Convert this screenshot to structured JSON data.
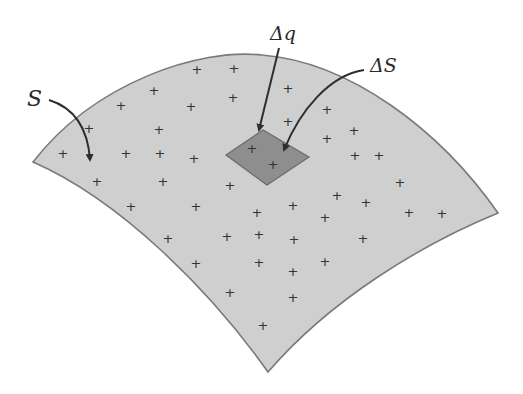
{
  "diagram": {
    "type": "surface-charge-density",
    "labels": {
      "surface": "S",
      "charge_element": "Δq",
      "area_element": "ΔS"
    },
    "colors": {
      "surface_fill": "#cfcfcf",
      "surface_edge": "#7a7a7a",
      "patch_fill": "#8e8e8e",
      "patch_edge": "#6a6a6a",
      "arrow": "#2e2e2e",
      "charge_mark": "#333333"
    },
    "charge_symbol": "+",
    "charges": [
      [
        197,
        69
      ],
      [
        234,
        68
      ],
      [
        154,
        90
      ],
      [
        233,
        97
      ],
      [
        121,
        105
      ],
      [
        191,
        106
      ],
      [
        89,
        128
      ],
      [
        159,
        129
      ],
      [
        160,
        153
      ],
      [
        63,
        153
      ],
      [
        126,
        153
      ],
      [
        194,
        158
      ],
      [
        97,
        181
      ],
      [
        163,
        181
      ],
      [
        230,
        185
      ],
      [
        131,
        206
      ],
      [
        196,
        206
      ],
      [
        257,
        212
      ],
      [
        168,
        238
      ],
      [
        227,
        236
      ],
      [
        259,
        234
      ],
      [
        196,
        263
      ],
      [
        259,
        262
      ],
      [
        230,
        292
      ],
      [
        293,
        297
      ],
      [
        263,
        325
      ],
      [
        293,
        271
      ],
      [
        325,
        261
      ],
      [
        294,
        239
      ],
      [
        325,
        217
      ],
      [
        363,
        238
      ],
      [
        293,
        205
      ],
      [
        337,
        195
      ],
      [
        366,
        202
      ],
      [
        409,
        212
      ],
      [
        442,
        213
      ],
      [
        400,
        182
      ],
      [
        379,
        155
      ],
      [
        355,
        155
      ],
      [
        327,
        138
      ],
      [
        354,
        130
      ],
      [
        288,
        88
      ],
      [
        327,
        109
      ],
      [
        288,
        121
      ],
      [
        252,
        148
      ],
      [
        273,
        164
      ]
    ]
  }
}
